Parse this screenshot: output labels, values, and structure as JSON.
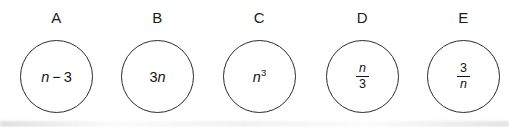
{
  "figure": {
    "colors": {
      "background": "#ffffff",
      "stroke": "#2b2b2b",
      "text": "#141414"
    },
    "circles": [
      {
        "label": "A",
        "expression": "n − 3",
        "tokens": {
          "a": "n",
          "op": "−",
          "b": "3"
        }
      },
      {
        "label": "B",
        "expression": "3n",
        "tokens": {
          "a": "3",
          "b": "n"
        }
      },
      {
        "label": "C",
        "expression": "n³",
        "tokens": {
          "base": "n",
          "sup": "3"
        }
      },
      {
        "label": "D",
        "expression": "n/3",
        "tokens": {
          "num": "n",
          "den": "3"
        }
      },
      {
        "label": "E",
        "expression": "3/n",
        "tokens": {
          "num": "3",
          "den": "n"
        }
      }
    ]
  }
}
